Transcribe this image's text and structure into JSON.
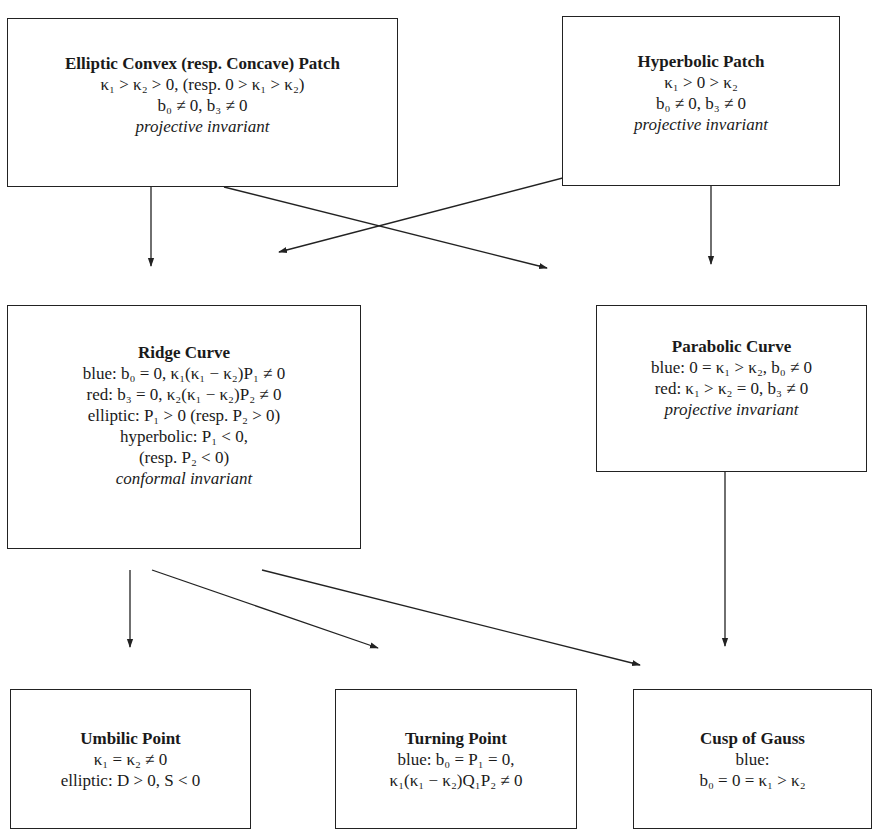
{
  "diagram": {
    "nodes": [
      {
        "id": "elliptic",
        "title": "Elliptic Convex (resp. Concave) Patch",
        "lines": [
          "κ₁ > κ₂ > 0, (resp. 0 > κ₁ > κ₂)",
          "b₀ ≠ 0, b₃ ≠ 0"
        ],
        "note": "projective invariant"
      },
      {
        "id": "hyperbolic",
        "title": "Hyperbolic Patch",
        "lines": [
          "κ₁ > 0 > κ₂",
          "b₀ ≠ 0, b₃ ≠ 0"
        ],
        "note": "projective invariant"
      },
      {
        "id": "ridge",
        "title": "Ridge Curve",
        "lines": [
          "blue: b₀ = 0, κ₁(κ₁ − κ₂)P₁ ≠ 0",
          "red: b₃ = 0, κ₂(κ₁ − κ₂)P₂ ≠ 0",
          "elliptic: P₁ > 0 (resp. P₂ > 0)",
          "hyperbolic: P₁ < 0,",
          "(resp. P₂ < 0)"
        ],
        "note": "conformal invariant"
      },
      {
        "id": "parabolic",
        "title": "Parabolic Curve",
        "lines": [
          "blue: 0 = κ₁ > κ₂, b₀ ≠ 0",
          "red: κ₁ > κ₂ = 0, b₃ ≠ 0"
        ],
        "note": "projective invariant"
      },
      {
        "id": "umbilic",
        "title": "Umbilic Point",
        "lines": [
          "κ₁ = κ₂ ≠ 0",
          "elliptic: D > 0, S < 0"
        ]
      },
      {
        "id": "turning",
        "title": "Turning Point",
        "lines": [
          "blue: b₀ = P₁ = 0,",
          "κ₁(κ₁ − κ₂)Q₁P₂ ≠ 0"
        ]
      },
      {
        "id": "cusp",
        "title": "Cusp of Gauss",
        "lines": [
          "blue:",
          "b₀ = 0 = κ₁ > κ₂"
        ]
      }
    ],
    "edges": [
      {
        "from": "elliptic",
        "to": "ridge"
      },
      {
        "from": "elliptic",
        "to": "parabolic"
      },
      {
        "from": "hyperbolic",
        "to": "ridge"
      },
      {
        "from": "hyperbolic",
        "to": "parabolic"
      },
      {
        "from": "ridge",
        "to": "umbilic"
      },
      {
        "from": "ridge",
        "to": "turning"
      },
      {
        "from": "ridge",
        "to": "cusp"
      },
      {
        "from": "parabolic",
        "to": "cusp"
      }
    ]
  }
}
